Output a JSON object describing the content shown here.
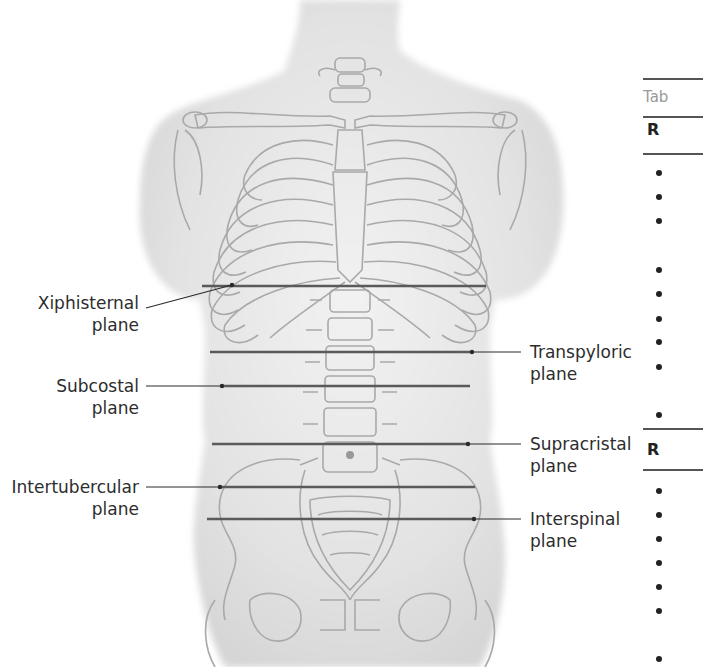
{
  "figure": {
    "labels_left": [
      {
        "id": "xiphisternal",
        "line1": "Xiphisternal",
        "line2": "plane"
      },
      {
        "id": "subcostal",
        "line1": "Subcostal",
        "line2": "plane"
      },
      {
        "id": "intertubercular",
        "line1": "Intertubercular",
        "line2": "plane"
      }
    ],
    "labels_right": [
      {
        "id": "transpyloric",
        "line1": "Transpyloric",
        "line2": "plane"
      },
      {
        "id": "supracristal",
        "line1": "Supracristal",
        "line2": "plane"
      },
      {
        "id": "interspinal",
        "line1": "Interspinal",
        "line2": "plane"
      }
    ],
    "colors": {
      "plane_line": "#555555",
      "bone_outline": "#a8a8a8",
      "skin": "#e6e6e6",
      "leader": "#222222"
    }
  },
  "table_panel": {
    "caption_partial": "Tab",
    "header1_partial": "R",
    "header2_partial": "R"
  }
}
